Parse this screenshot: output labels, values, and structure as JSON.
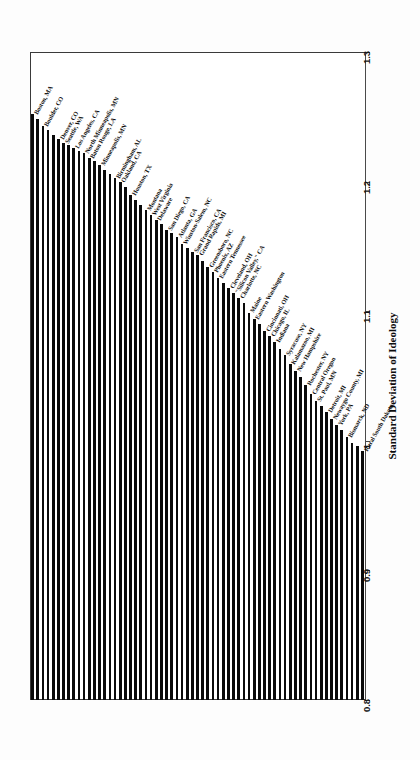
{
  "chart_data": {
    "type": "bar",
    "orientation": "rotated-90",
    "title": "",
    "xlabel": "Standard Deviation of Ideology",
    "ylabel": "",
    "ylim": [
      0.8,
      1.3
    ],
    "ticks": [
      "0.8",
      "0.9",
      "1",
      "1.1",
      "1.2",
      "1.3"
    ],
    "tick_values": [
      0.8,
      0.9,
      1.0,
      1.1,
      1.2,
      1.3
    ],
    "grid": false,
    "legend": "none",
    "bar_color": "#0a0a0a",
    "categories": [
      "Boston, MA",
      "Boulder, CO",
      "Denver, CO",
      "Seattle, WA",
      "Los Angeles, CA",
      "North Minneapolis, MN",
      "Baton Rouge, LA",
      "Minneapolis, MN",
      "Birmingham, AL",
      "Oakland, CA",
      "Houston, TX",
      "Montana",
      "West Virginia",
      "Delaware",
      "San Diego, CA",
      "Atlanta, GA",
      "Winston-Salem, NC",
      "San Francisco, CA",
      "Grand Rapids, MI",
      "Greensboro, NC",
      "Phoenix, AZ",
      "Eastern Tennessee",
      "Cleveland, OH",
      "\"Silicon Valley,\" CA",
      "Charlotte, NC",
      "Maine",
      "Eastern Washington",
      "Cincinnati, OH",
      "Chicago, IL",
      "Indiana",
      "Syracuse, NY",
      "Kalamazoo, MI",
      "New Hampshire",
      "Rochester, NY",
      "Central Oregon",
      "St. Paul, MN",
      "Detroit, MI",
      "Newaygo County, MI",
      "York, PA",
      "Bismarck, ND",
      "Rural South Dakota",
      "",
      "",
      "",
      "",
      "",
      "",
      "",
      "",
      "",
      "",
      "",
      "",
      "",
      "",
      "",
      "",
      "",
      "",
      "",
      "",
      "",
      "",
      "",
      ""
    ],
    "values": [
      1.252,
      1.243,
      1.233,
      1.23,
      1.226,
      1.222,
      1.218,
      1.213,
      1.203,
      1.2,
      1.19,
      1.178,
      1.174,
      1.17,
      1.163,
      1.157,
      1.152,
      1.146,
      1.143,
      1.134,
      1.13,
      1.126,
      1.118,
      1.114,
      1.11,
      1.099,
      1.094,
      1.085,
      1.081,
      1.076,
      1.066,
      1.059,
      1.054,
      1.043,
      1.036,
      1.031,
      1.022,
      1.017,
      1.012,
      1.003,
      0.992,
      1.248,
      1.24,
      1.236,
      1.228,
      1.224,
      1.216,
      1.209,
      1.206,
      1.196,
      1.186,
      1.182,
      1.167,
      1.16,
      1.149,
      1.139,
      1.122,
      1.106,
      1.09,
      1.071,
      1.049,
      1.027,
      1.008,
      0.998,
      0.996
    ],
    "n_bars": 65,
    "max_label": "Boston, MA",
    "min_label": "Rural South Dakota"
  }
}
